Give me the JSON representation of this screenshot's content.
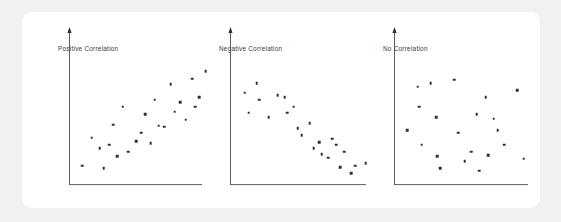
{
  "figure": {
    "background_color": "#f1f1f1",
    "card_color": "#ffffff",
    "axis_color": "#4a4a4a",
    "point_color": "#2f2f2f",
    "title_color": "#3a3a3a"
  },
  "chart_data": [
    {
      "type": "scatter",
      "title": "Positive Correlation",
      "xlabel": "",
      "ylabel": "",
      "xlim": [
        0,
        100
      ],
      "ylim": [
        0,
        100
      ],
      "grid": false,
      "legend": "none",
      "axis_style": "l-shaped-arrows",
      "points": [
        {
          "x": 4,
          "y": 12
        },
        {
          "x": 11,
          "y": 36
        },
        {
          "x": 17,
          "y": 27
        },
        {
          "x": 20,
          "y": 10
        },
        {
          "x": 24,
          "y": 30
        },
        {
          "x": 27,
          "y": 47
        },
        {
          "x": 30,
          "y": 20
        },
        {
          "x": 34,
          "y": 62
        },
        {
          "x": 38,
          "y": 24
        },
        {
          "x": 44,
          "y": 33
        },
        {
          "x": 48,
          "y": 40
        },
        {
          "x": 51,
          "y": 56
        },
        {
          "x": 55,
          "y": 31
        },
        {
          "x": 58,
          "y": 68
        },
        {
          "x": 61,
          "y": 46
        },
        {
          "x": 65,
          "y": 45
        },
        {
          "x": 70,
          "y": 81
        },
        {
          "x": 73,
          "y": 58
        },
        {
          "x": 77,
          "y": 66
        },
        {
          "x": 81,
          "y": 51
        },
        {
          "x": 86,
          "y": 86
        },
        {
          "x": 88,
          "y": 62
        },
        {
          "x": 91,
          "y": 70
        },
        {
          "x": 96,
          "y": 92
        }
      ]
    },
    {
      "type": "scatter",
      "title": "Negative Correlation",
      "xlabel": "",
      "ylabel": "",
      "xlim": [
        0,
        100
      ],
      "ylim": [
        0,
        100
      ],
      "grid": false,
      "legend": "none",
      "axis_style": "l-shaped-arrows",
      "points": [
        {
          "x": 5,
          "y": 74
        },
        {
          "x": 8,
          "y": 57
        },
        {
          "x": 14,
          "y": 82
        },
        {
          "x": 16,
          "y": 68
        },
        {
          "x": 23,
          "y": 53
        },
        {
          "x": 30,
          "y": 72
        },
        {
          "x": 35,
          "y": 70
        },
        {
          "x": 37,
          "y": 57
        },
        {
          "x": 42,
          "y": 62
        },
        {
          "x": 45,
          "y": 44
        },
        {
          "x": 48,
          "y": 38
        },
        {
          "x": 54,
          "y": 48
        },
        {
          "x": 57,
          "y": 27
        },
        {
          "x": 61,
          "y": 32
        },
        {
          "x": 63,
          "y": 22
        },
        {
          "x": 68,
          "y": 19
        },
        {
          "x": 71,
          "y": 35
        },
        {
          "x": 74,
          "y": 30
        },
        {
          "x": 77,
          "y": 11
        },
        {
          "x": 80,
          "y": 24
        },
        {
          "x": 85,
          "y": 6
        },
        {
          "x": 88,
          "y": 12
        },
        {
          "x": 96,
          "y": 14
        }
      ]
    },
    {
      "type": "scatter",
      "title": "No Correlation",
      "xlabel": "",
      "ylabel": "",
      "xlim": [
        0,
        100
      ],
      "ylim": [
        0,
        100
      ],
      "grid": false,
      "legend": "none",
      "axis_style": "l-shaped-arrows",
      "points": [
        {
          "x": 4,
          "y": 42
        },
        {
          "x": 12,
          "y": 79
        },
        {
          "x": 13,
          "y": 62
        },
        {
          "x": 15,
          "y": 30
        },
        {
          "x": 22,
          "y": 82
        },
        {
          "x": 26,
          "y": 53
        },
        {
          "x": 27,
          "y": 20
        },
        {
          "x": 29,
          "y": 10
        },
        {
          "x": 40,
          "y": 85
        },
        {
          "x": 43,
          "y": 40
        },
        {
          "x": 48,
          "y": 16
        },
        {
          "x": 53,
          "y": 24
        },
        {
          "x": 57,
          "y": 56
        },
        {
          "x": 59,
          "y": 8
        },
        {
          "x": 64,
          "y": 70
        },
        {
          "x": 66,
          "y": 21
        },
        {
          "x": 70,
          "y": 52
        },
        {
          "x": 73,
          "y": 42
        },
        {
          "x": 78,
          "y": 30
        },
        {
          "x": 88,
          "y": 76
        },
        {
          "x": 93,
          "y": 18
        }
      ]
    }
  ],
  "panels": [
    {
      "name": "positive-correlation",
      "title": "Positive Correlation"
    },
    {
      "name": "negative-correlation",
      "title": "Negative Correlation"
    },
    {
      "name": "no-correlation",
      "title": "No Correlation"
    }
  ]
}
